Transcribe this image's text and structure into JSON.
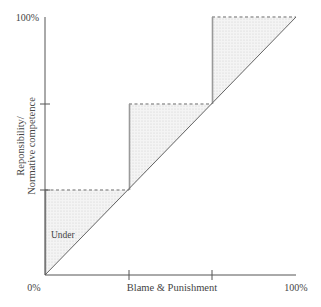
{
  "diagram": {
    "type": "step-diagram",
    "x_axis": {
      "label": "Blame & Punishment",
      "min_label": "0%",
      "max_label": "100%",
      "ticks": [
        0,
        33.3,
        66.7,
        100
      ]
    },
    "y_axis": {
      "label_line1": "Reponsibility/",
      "label_line2": "Normative competence",
      "max_label": "100%",
      "ticks": [
        0,
        33.3,
        66.7,
        100
      ]
    },
    "region_label": "Under",
    "diagonal": "equal line from 0%,0% to 100%,100%",
    "steps": [
      {
        "x_from": 0,
        "x_to": 33.3,
        "y": 33.3
      },
      {
        "x_from": 33.3,
        "x_to": 66.7,
        "y": 66.7
      },
      {
        "x_from": 66.7,
        "x_to": 100,
        "y": 100
      }
    ],
    "colors": {
      "axis": "#555555",
      "step_line": "#9a9a9a",
      "shading": "#e8e8e8",
      "text": "#444444"
    }
  }
}
